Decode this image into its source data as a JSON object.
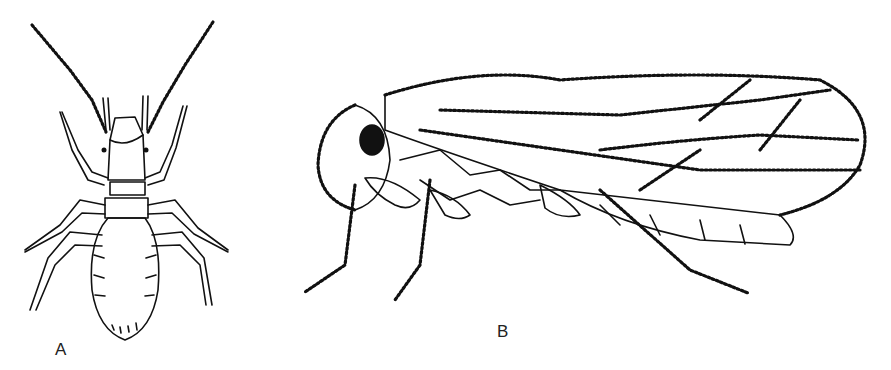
{
  "figure": {
    "panels": [
      {
        "id": "A",
        "label": "A",
        "subject": "wingless insect, dorsal view"
      },
      {
        "id": "B",
        "label": "B",
        "subject": "winged insect, lateral view"
      }
    ],
    "colors": {
      "line": "#111111",
      "background": "#ffffff"
    }
  }
}
